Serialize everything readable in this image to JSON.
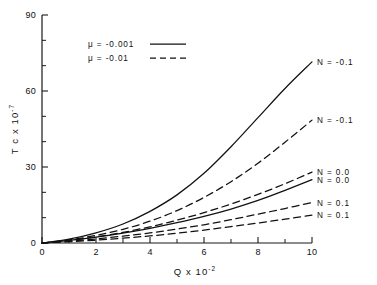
{
  "chart_data": {
    "type": "line",
    "title": "",
    "xlabel": "Q x 10-2",
    "xlabel_base": "Q  x  10",
    "xlabel_exp": "-2",
    "ylabel_base": "T c  x  10",
    "ylabel_exp": "-7",
    "ylabel": "T c x 10-7",
    "xlim": [
      0,
      10
    ],
    "ylim": [
      0,
      90
    ],
    "xticks": [
      0,
      2,
      4,
      6,
      8,
      10
    ],
    "xtick_labels": [
      "0",
      "2",
      "4",
      "6",
      "8",
      "10"
    ],
    "yticks": [
      0,
      30,
      60,
      90
    ],
    "ytick_labels": [
      "0",
      "30",
      "60",
      "90"
    ],
    "x_minor_step": 1,
    "y_minor_step": 10,
    "grid": false,
    "legend_position": "upper-left-inside",
    "legend": [
      {
        "label": "μ  =   -0.001",
        "style": "solid"
      },
      {
        "label": "μ  =   -0.01",
        "style": "dashed"
      }
    ],
    "series": [
      {
        "name": "mu=-0.001, N=-0.1",
        "label": "N  =  -0.1",
        "style": "solid",
        "x": [
          0,
          1,
          2,
          3,
          4,
          5,
          6,
          7,
          8,
          9,
          10
        ],
        "y": [
          0,
          1.5,
          4.0,
          7.5,
          12.5,
          19.0,
          27.5,
          38.0,
          49.5,
          61.0,
          71.5
        ]
      },
      {
        "name": "mu=-0.01, N=-0.1",
        "label": "N  =  -0.1",
        "style": "dashed",
        "x": [
          0,
          1,
          2,
          3,
          4,
          5,
          6,
          7,
          8,
          9,
          10
        ],
        "y": [
          0,
          1.2,
          3.0,
          5.4,
          8.6,
          12.8,
          18.0,
          24.2,
          31.5,
          39.8,
          48.5
        ]
      },
      {
        "name": "mu=-0.01, N=0.0",
        "label": "N  =  0.0",
        "style": "dashed",
        "x": [
          0,
          1,
          2,
          3,
          4,
          5,
          6,
          7,
          8,
          9,
          10
        ],
        "y": [
          0,
          1.0,
          2.4,
          4.2,
          6.4,
          9.0,
          12.0,
          15.4,
          19.2,
          23.4,
          28.0
        ]
      },
      {
        "name": "mu=-0.001, N=0.0",
        "label": "N  =  0.0",
        "style": "solid",
        "x": [
          0,
          1,
          2,
          3,
          4,
          5,
          6,
          7,
          8,
          9,
          10
        ],
        "y": [
          0,
          1.0,
          2.3,
          3.9,
          5.8,
          8.0,
          10.5,
          13.4,
          16.8,
          20.8,
          25.0
        ]
      },
      {
        "name": "mu=-0.01, N=0.1",
        "label": "N  =  0.1",
        "style": "dashed",
        "x": [
          0,
          1,
          2,
          3,
          4,
          5,
          6,
          7,
          8,
          9,
          10
        ],
        "y": [
          0,
          0.7,
          1.6,
          2.7,
          4.0,
          5.5,
          7.2,
          9.2,
          11.4,
          13.6,
          16.0
        ]
      },
      {
        "name": "mu=-0.01, N=0.1 (lower)",
        "label": "N  =  0.1",
        "style": "dashed",
        "x": [
          0,
          1,
          2,
          3,
          4,
          5,
          6,
          7,
          8,
          9,
          10
        ],
        "y": [
          0,
          0.5,
          1.1,
          1.9,
          2.8,
          3.9,
          5.1,
          6.5,
          7.9,
          9.4,
          11.0
        ]
      }
    ]
  }
}
